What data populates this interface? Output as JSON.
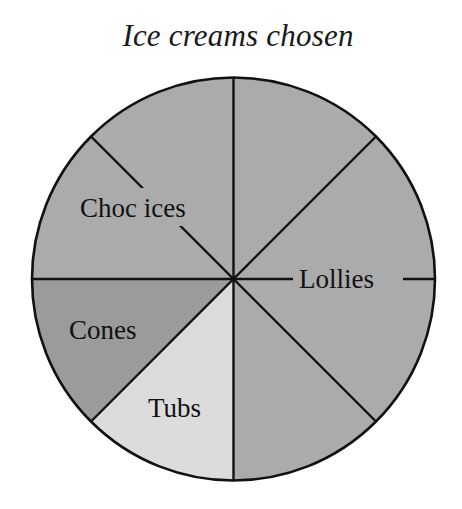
{
  "chart_data": {
    "type": "pie",
    "title": "Ice creams chosen",
    "divisions": 8,
    "categories": [
      "Lollies",
      "Tubs",
      "Cones",
      "Choc ices"
    ],
    "values": [
      4,
      1,
      1,
      2
    ],
    "fractions": [
      0.5,
      0.125,
      0.125,
      0.25
    ],
    "slices": [
      {
        "label": "Lollies",
        "sectors": 4,
        "fraction": 0.5,
        "color": "#ababab",
        "start_deg": 0,
        "end_deg": 180
      },
      {
        "label": "Tubs",
        "sectors": 1,
        "fraction": 0.125,
        "color": "#dcdcdc",
        "start_deg": 180,
        "end_deg": 225
      },
      {
        "label": "Cones",
        "sectors": 1,
        "fraction": 0.125,
        "color": "#9b9b9b",
        "start_deg": 225,
        "end_deg": 270
      },
      {
        "label": "Choc ices",
        "sectors": 2,
        "fraction": 0.25,
        "color": "#ababab",
        "start_deg": 270,
        "end_deg": 360
      }
    ],
    "legend": "none (labels inside slices)",
    "xlabel": "",
    "ylabel": ""
  },
  "labels": {
    "title": "Ice creams chosen",
    "choc_ices": "Choc ices",
    "lollies": "Lollies",
    "cones": "Cones",
    "tubs": "Tubs"
  },
  "colors": {
    "outline": "#111111",
    "main_fill": "#ababab",
    "cones_fill": "#9b9b9b",
    "tubs_fill": "#dcdcdc"
  }
}
